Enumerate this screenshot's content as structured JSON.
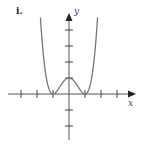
{
  "figure": {
    "label": "i.",
    "x_axis_label": "x",
    "y_axis_label": "y"
  },
  "chart_data": {
    "type": "line",
    "title": "",
    "function_shape": "quartic, double roots at x=-1 and x=1, local max at (0,1)",
    "xlabel": "x",
    "ylabel": "y",
    "x_ticks": [
      -3,
      -2,
      -1,
      1,
      2,
      3
    ],
    "y_ticks": [
      -2,
      -1,
      1,
      2,
      3,
      4
    ],
    "key_points": [
      {
        "x": -1,
        "y": 0
      },
      {
        "x": 0,
        "y": 1
      },
      {
        "x": 1,
        "y": 0
      }
    ],
    "xlim": [
      -3.0,
      3.0
    ],
    "ylim": [
      -2.5,
      5.0
    ],
    "grid": false
  },
  "colors": {
    "axis": "#333333",
    "curve": "#777777",
    "label": "#222222"
  }
}
